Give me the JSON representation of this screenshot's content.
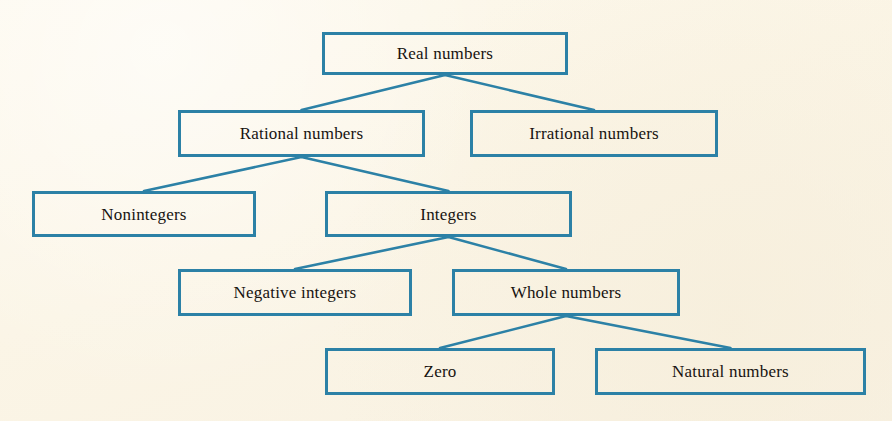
{
  "diagram": {
    "theme": {
      "background_color": "#fbf6e8",
      "box_border_color": "#2c81a6",
      "connector_color": "#2c81a6",
      "text_color": "#171310"
    },
    "nodes": [
      {
        "id": "real-numbers",
        "label": "Real numbers",
        "level": 1,
        "x": 322,
        "y": 32,
        "w": 246,
        "h": 43
      },
      {
        "id": "rational-numbers",
        "label": "Rational numbers",
        "level": 2,
        "x": 178,
        "y": 110,
        "w": 247,
        "h": 47
      },
      {
        "id": "irrational-numbers",
        "label": "Irrational numbers",
        "level": 2,
        "x": 470,
        "y": 110,
        "w": 248,
        "h": 47
      },
      {
        "id": "nonintegers",
        "label": "Nonintegers",
        "level": 3,
        "x": 32,
        "y": 191,
        "w": 224,
        "h": 46
      },
      {
        "id": "integers",
        "label": "Integers",
        "level": 3,
        "x": 325,
        "y": 191,
        "w": 247,
        "h": 46
      },
      {
        "id": "negative-integers",
        "label": "Negative integers",
        "level": 4,
        "x": 178,
        "y": 269,
        "w": 234,
        "h": 47
      },
      {
        "id": "whole-numbers",
        "label": "Whole numbers",
        "level": 4,
        "x": 452,
        "y": 269,
        "w": 228,
        "h": 47
      },
      {
        "id": "zero",
        "label": "Zero",
        "level": 5,
        "x": 325,
        "y": 348,
        "w": 230,
        "h": 47
      },
      {
        "id": "natural-numbers",
        "label": "Natural numbers",
        "level": 5,
        "x": 595,
        "y": 348,
        "w": 271,
        "h": 47
      }
    ],
    "edges": [
      {
        "from": "real-numbers",
        "to": "rational-numbers"
      },
      {
        "from": "real-numbers",
        "to": "irrational-numbers"
      },
      {
        "from": "rational-numbers",
        "to": "nonintegers"
      },
      {
        "from": "rational-numbers",
        "to": "integers"
      },
      {
        "from": "integers",
        "to": "negative-integers"
      },
      {
        "from": "integers",
        "to": "whole-numbers"
      },
      {
        "from": "whole-numbers",
        "to": "zero"
      },
      {
        "from": "whole-numbers",
        "to": "natural-numbers"
      }
    ]
  }
}
